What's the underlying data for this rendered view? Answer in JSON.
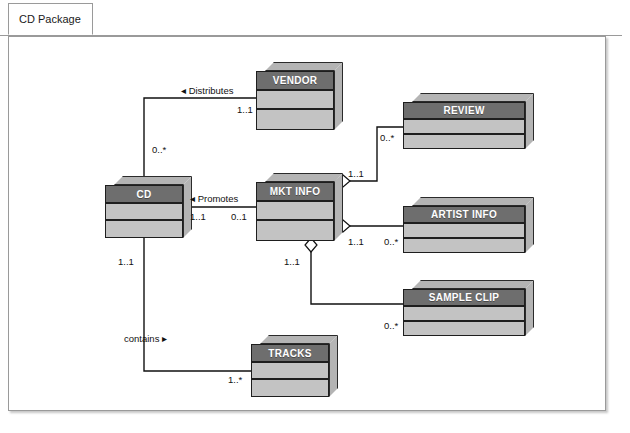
{
  "window": {
    "tab_label": "CD Package"
  },
  "diagram": {
    "type": "uml-class-diagram",
    "classes": [
      {
        "id": "vendor",
        "name": "VENDOR",
        "x": 256,
        "y": 62,
        "w": 78,
        "h": 68,
        "compartments": 3
      },
      {
        "id": "review",
        "name": "REVIEW",
        "x": 403,
        "y": 93,
        "w": 122,
        "h": 56,
        "compartments": 3
      },
      {
        "id": "cd",
        "name": "CD",
        "x": 105,
        "y": 176,
        "w": 78,
        "h": 62,
        "compartments": 3
      },
      {
        "id": "mkt-info",
        "name": "MKT INFO",
        "x": 256,
        "y": 173,
        "w": 78,
        "h": 68,
        "compartments": 3
      },
      {
        "id": "artist-info",
        "name": "ARTIST INFO",
        "x": 403,
        "y": 197,
        "w": 122,
        "h": 56,
        "compartments": 3
      },
      {
        "id": "sample-clip",
        "name": "SAMPLE CLIP",
        "x": 403,
        "y": 280,
        "w": 122,
        "h": 56,
        "compartments": 3
      },
      {
        "id": "tracks",
        "name": "TRACKS",
        "x": 251,
        "y": 335,
        "w": 78,
        "h": 62,
        "compartments": 3
      }
    ],
    "associations": [
      {
        "id": "cd-distributes-vendor",
        "from": "cd",
        "to": "vendor",
        "role_label": "Distributes",
        "role_arrow": "left",
        "from_multiplicity": "0..*",
        "to_multiplicity": "1..1",
        "aggregation": "none"
      },
      {
        "id": "cd-promotes-mktinfo",
        "from": "cd",
        "to": "mkt-info",
        "role_label": "Promotes",
        "role_arrow": "left",
        "from_multiplicity": "1..1",
        "to_multiplicity": "0..1",
        "aggregation": "none"
      },
      {
        "id": "mktinfo-review",
        "from": "mkt-info",
        "to": "review",
        "role_label": "",
        "from_multiplicity": "1..1",
        "to_multiplicity": "0..*",
        "aggregation": "diamond"
      },
      {
        "id": "mktinfo-artistinfo",
        "from": "mkt-info",
        "to": "artist-info",
        "role_label": "",
        "from_multiplicity": "1..1",
        "to_multiplicity": "0..*",
        "aggregation": "diamond"
      },
      {
        "id": "mktinfo-sampleclip",
        "from": "mkt-info",
        "to": "sample-clip",
        "role_label": "",
        "from_multiplicity": "1..1",
        "to_multiplicity": "0..*",
        "aggregation": "diamond"
      },
      {
        "id": "cd-contains-tracks",
        "from": "cd",
        "to": "tracks",
        "role_label": "contains",
        "role_arrow": "right",
        "from_multiplicity": "1..1",
        "to_multiplicity": "1..*",
        "aggregation": "none"
      }
    ],
    "labels": {
      "distributes": "Distributes",
      "distributes_arrow": "◂",
      "promotes": "Promotes",
      "promotes_arrow": "◂",
      "contains": "contains",
      "contains_arrow": "▸",
      "vendor_to_mult": "1..1",
      "cd_vendor_mult": "0..*",
      "cd_promotes_mult": "1..1",
      "mktinfo_promotes_mult": "0..1",
      "mktinfo_review_mult": "1..1",
      "review_mult": "0..*",
      "mktinfo_artist_mult": "1..1",
      "artist_mult": "0..*",
      "mktinfo_sample_mult": "1..1",
      "sample_mult": "0..*",
      "cd_tracks_mult": "1..1",
      "tracks_mult": "1..*"
    }
  },
  "colors": {
    "name_compartment": "#6e6e6e",
    "body_compartment": "#c3c3c3",
    "depth_face": "#b4b4b4",
    "outline": "#1e1e1e",
    "connector": "#111111",
    "frame_border": "#9a9a9a",
    "canvas": "#ffffff"
  }
}
